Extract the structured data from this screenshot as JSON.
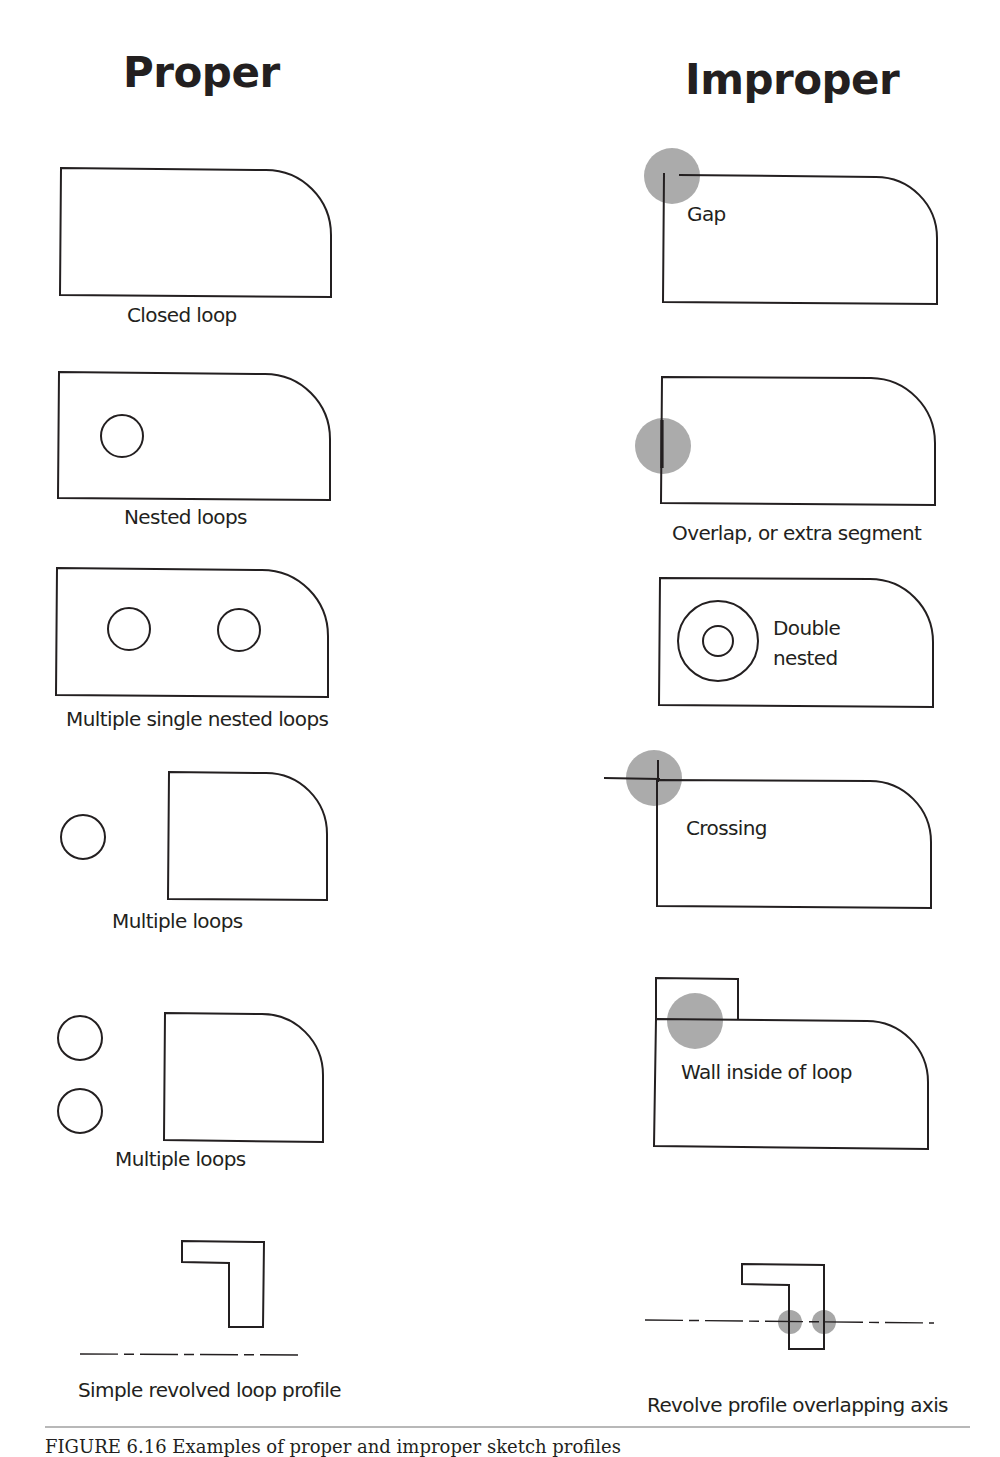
{
  "headings": {
    "proper": "Proper",
    "improper": "Improper"
  },
  "proper": {
    "items": [
      {
        "label": "Closed loop"
      },
      {
        "label": "Nested loops"
      },
      {
        "label": "Multiple single nested loops"
      },
      {
        "label": "Multiple loops"
      },
      {
        "label": "Multiple loops"
      },
      {
        "label": "Simple revolved loop profile"
      }
    ]
  },
  "improper": {
    "items": [
      {
        "label": "Gap"
      },
      {
        "label": "Overlap, or extra segment"
      },
      {
        "label": "Double nested",
        "line1": "Double",
        "line2": "nested"
      },
      {
        "label": "Crossing"
      },
      {
        "label": "Wall inside of loop"
      },
      {
        "label": "Revolve profile overlapping axis"
      }
    ]
  },
  "caption": "FIGURE 6.16  Examples of proper and improper sketch profiles",
  "colors": {
    "stroke": "#231f20",
    "highlight": "#a7a7a7",
    "rule": "#b8b8b8"
  }
}
